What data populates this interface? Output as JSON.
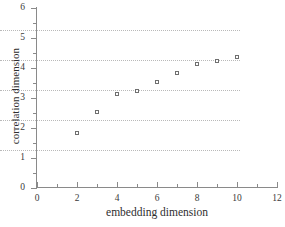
{
  "chart_data": {
    "type": "scatter",
    "title": "",
    "xlabel": "embedding dimension",
    "ylabel": "correlation dimension",
    "xlim": [
      0,
      12
    ],
    "ylim": [
      0,
      6
    ],
    "xticks": [
      0,
      2,
      4,
      6,
      8,
      10,
      12
    ],
    "xtick_labels": [
      "0",
      "2",
      "4",
      "6",
      "8",
      "10",
      "12"
    ],
    "xminor_ticks": [
      1,
      3,
      5,
      7,
      9,
      11
    ],
    "yticks": [
      0,
      1,
      2,
      3,
      4,
      5,
      6
    ],
    "ytick_labels": [
      "0",
      "1",
      "2",
      "3",
      "4",
      "5",
      "6"
    ],
    "yminor_ticks": [
      0.5,
      1.5,
      2.5,
      3.5,
      4.5,
      5.5
    ],
    "grid": "horizontal-dotted",
    "gridlines_y": [
      1,
      2,
      3,
      4,
      5
    ],
    "legend": "none",
    "marker": "open-square",
    "marker_color": "#6f6f6f",
    "x": [
      2,
      3,
      4,
      5,
      6,
      7,
      8,
      9,
      10
    ],
    "values": [
      1.82,
      2.52,
      3.13,
      3.24,
      3.54,
      3.84,
      4.14,
      4.25,
      4.36
    ],
    "points": [
      {
        "x": 2,
        "y": 1.82
      },
      {
        "x": 3,
        "y": 2.52
      },
      {
        "x": 4,
        "y": 3.13
      },
      {
        "x": 5,
        "y": 3.24
      },
      {
        "x": 6,
        "y": 3.54
      },
      {
        "x": 7,
        "y": 3.84
      },
      {
        "x": 8,
        "y": 4.14
      },
      {
        "x": 9,
        "y": 4.25
      },
      {
        "x": 10,
        "y": 4.36
      }
    ]
  },
  "colors": {
    "axis": "#8a8a8a",
    "grid": "#b9b9b9",
    "text": "#2e2e2e",
    "marker_edge": "#6f6f6f",
    "background": "#ffffff"
  }
}
